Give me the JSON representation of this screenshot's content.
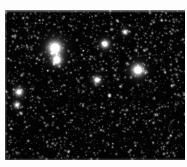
{
  "image": {
    "kind": "astronomical-star-field",
    "description": "Dense monochrome stellar field image",
    "palette": {
      "background": "#ffffff",
      "sky": "#030303",
      "star_bright": "#ffffff",
      "star_mid": "#c8c8c8",
      "star_faint": "#6e6e6e"
    },
    "frame": {
      "left": 5,
      "top": 10,
      "width": 180,
      "height": 150
    },
    "star_counts": {
      "bright_labeled": 8,
      "medium": 160,
      "faint_background": 1800
    }
  },
  "chart_data": {
    "type": "scatter",
    "title": "",
    "subtitle": "",
    "xlabel": "",
    "ylabel": "",
    "xlim": [
      0,
      180
    ],
    "ylim": [
      0,
      150
    ],
    "grid": false,
    "legend": false,
    "colormap": "grayscale",
    "series": [
      {
        "name": "bright stars",
        "points": [
          {
            "x": 50,
            "y": 38,
            "r": 11.5,
            "peak": 1.0
          },
          {
            "x": 52,
            "y": 50,
            "r": 8.0,
            "peak": 0.92
          },
          {
            "x": 133,
            "y": 60,
            "r": 9.5,
            "peak": 0.95
          },
          {
            "x": 100,
            "y": 34,
            "r": 6.5,
            "peak": 0.86
          },
          {
            "x": 92,
            "y": 70,
            "r": 6.0,
            "peak": 0.8
          },
          {
            "x": 14,
            "y": 82,
            "r": 6.5,
            "peak": 0.78
          },
          {
            "x": 12,
            "y": 95,
            "r": 5.0,
            "peak": 0.7
          },
          {
            "x": 120,
            "y": 22,
            "r": 4.5,
            "peak": 0.72
          }
        ]
      },
      {
        "name": "medium stars",
        "points": [
          {
            "x": 22,
            "y": 14,
            "r": 2.6,
            "peak": 0.62
          },
          {
            "x": 38,
            "y": 10,
            "r": 2.2,
            "peak": 0.55
          },
          {
            "x": 66,
            "y": 16,
            "r": 2.4,
            "peak": 0.6
          },
          {
            "x": 88,
            "y": 12,
            "r": 2.0,
            "peak": 0.52
          },
          {
            "x": 112,
            "y": 10,
            "r": 2.2,
            "peak": 0.58
          },
          {
            "x": 146,
            "y": 14,
            "r": 2.6,
            "peak": 0.64
          },
          {
            "x": 168,
            "y": 20,
            "r": 2.4,
            "peak": 0.6
          },
          {
            "x": 10,
            "y": 28,
            "r": 2.0,
            "peak": 0.5
          },
          {
            "x": 30,
            "y": 26,
            "r": 2.2,
            "peak": 0.54
          },
          {
            "x": 72,
            "y": 30,
            "r": 2.5,
            "peak": 0.62
          },
          {
            "x": 150,
            "y": 36,
            "r": 2.4,
            "peak": 0.6
          },
          {
            "x": 176,
            "y": 42,
            "r": 2.2,
            "peak": 0.55
          },
          {
            "x": 26,
            "y": 48,
            "r": 2.0,
            "peak": 0.5
          },
          {
            "x": 64,
            "y": 52,
            "r": 2.6,
            "peak": 0.64
          },
          {
            "x": 108,
            "y": 58,
            "r": 2.2,
            "peak": 0.56
          },
          {
            "x": 160,
            "y": 62,
            "r": 2.4,
            "peak": 0.6
          },
          {
            "x": 44,
            "y": 72,
            "r": 2.2,
            "peak": 0.54
          },
          {
            "x": 128,
            "y": 78,
            "r": 2.0,
            "peak": 0.5
          },
          {
            "x": 170,
            "y": 84,
            "r": 2.3,
            "peak": 0.58
          },
          {
            "x": 34,
            "y": 92,
            "r": 2.1,
            "peak": 0.52
          },
          {
            "x": 78,
            "y": 96,
            "r": 2.5,
            "peak": 0.62
          },
          {
            "x": 118,
            "y": 100,
            "r": 2.2,
            "peak": 0.55
          },
          {
            "x": 152,
            "y": 104,
            "r": 2.0,
            "peak": 0.5
          },
          {
            "x": 20,
            "y": 112,
            "r": 2.3,
            "peak": 0.57
          },
          {
            "x": 60,
            "y": 116,
            "r": 2.1,
            "peak": 0.52
          },
          {
            "x": 96,
            "y": 120,
            "r": 2.6,
            "peak": 0.64
          },
          {
            "x": 136,
            "y": 122,
            "r": 2.2,
            "peak": 0.56
          },
          {
            "x": 174,
            "y": 126,
            "r": 2.0,
            "peak": 0.5
          },
          {
            "x": 42,
            "y": 132,
            "r": 2.4,
            "peak": 0.6
          },
          {
            "x": 84,
            "y": 138,
            "r": 2.2,
            "peak": 0.55
          },
          {
            "x": 124,
            "y": 142,
            "r": 2.5,
            "peak": 0.62
          },
          {
            "x": 164,
            "y": 146,
            "r": 2.1,
            "peak": 0.52
          },
          {
            "x": 8,
            "y": 140,
            "r": 2.0,
            "peak": 0.5
          },
          {
            "x": 104,
            "y": 86,
            "r": 2.8,
            "peak": 0.66
          },
          {
            "x": 56,
            "y": 84,
            "r": 2.4,
            "peak": 0.58
          }
        ]
      }
    ],
    "annotations": []
  }
}
